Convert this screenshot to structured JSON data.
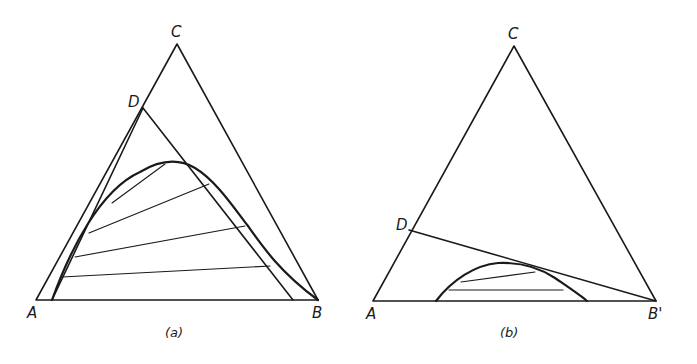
{
  "figure": {
    "panels": [
      {
        "id": "a",
        "caption": "(a)",
        "vertices": {
          "A": "A",
          "B": "B",
          "C": "C",
          "D": "D"
        },
        "description": "Ternary diagram ABC with line DB, binodal curve and four tie lines"
      },
      {
        "id": "b",
        "caption": "(b)",
        "vertices": {
          "A": "A",
          "B": "B'",
          "C": "C",
          "D": "D"
        },
        "description": "Ternary diagram ABC with line DB', small binodal dome and two tie lines"
      }
    ],
    "colors": {
      "line": "#1a1a1a",
      "background": "#ffffff"
    }
  }
}
